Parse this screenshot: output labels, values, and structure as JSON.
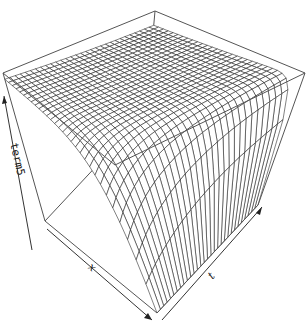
{
  "chart_data": {
    "type": "surface",
    "title": "",
    "renderer": "persp wireframe",
    "xlabel": "x",
    "ylabel": "t",
    "zlabel": "term5",
    "grid_resolution": {
      "nx": 30,
      "nt": 30
    },
    "surface_shape": "sigmoid rise along x edge near front/left, then flat plateau at maximum toward back; slight curvature along t",
    "zlim_normalized": [
      0,
      1
    ],
    "axis_ticks": "none (arrows only)",
    "colors": {
      "mesh_line": "#1a1a1a",
      "mesh_fill": "#ffffff",
      "box": "#555555",
      "background": "#ffffff"
    }
  },
  "axes": {
    "x_label": "x",
    "t_label": "t",
    "z_label": "term5"
  }
}
